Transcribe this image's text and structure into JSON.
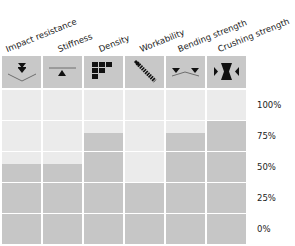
{
  "chart_data": {
    "type": "bar",
    "title": "",
    "xlabel": "",
    "ylabel": "",
    "ylim": [
      0,
      100
    ],
    "y_ticks": [
      "100%",
      "75%",
      "50%",
      "25%",
      "0%"
    ],
    "categories": [
      "Impact resistance",
      "Stiffness",
      "Density",
      "Workability",
      "Bending strength",
      "Crushing strength"
    ],
    "values": [
      40,
      40,
      65,
      25,
      65,
      75
    ],
    "icons": [
      "impact-icon",
      "stiffness-icon",
      "density-icon",
      "workability-icon",
      "bending-icon",
      "crushing-icon"
    ],
    "colors": {
      "filled": "#c6c6c6",
      "empty": "#ebebeb",
      "header": "#c8c8c8"
    }
  }
}
